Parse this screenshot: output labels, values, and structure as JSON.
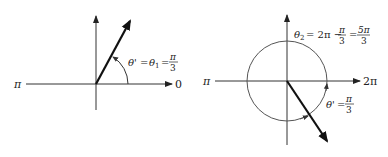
{
  "left": {
    "axis_left_label": "π",
    "axis_right_label": "0",
    "angle_label": {
      "theta_prime": "θ'",
      "eq1": "=",
      "theta": "θ",
      "sub": "1",
      "eq2": "=",
      "num": "π",
      "den": "3"
    }
  },
  "right": {
    "axis_left_label": "π",
    "axis_right_label": "2π",
    "theta2_label": {
      "theta": "θ",
      "sub": "2",
      "expr": "= 2π −",
      "num1": "π",
      "den1": "3",
      "eq": "=",
      "num2": "5π",
      "den2": "3"
    },
    "ref_label": {
      "theta_prime": "θ'",
      "eq": "=",
      "num": "π",
      "den": "3"
    }
  },
  "colors": {
    "axis": "#333333",
    "vector": "#111111",
    "circle": "#555555"
  }
}
